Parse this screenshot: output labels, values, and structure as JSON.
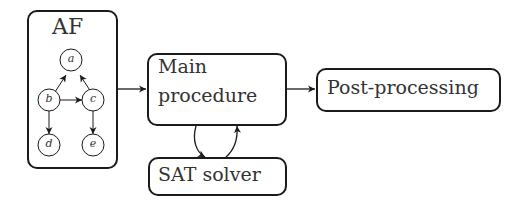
{
  "diagram": {
    "af_box": {
      "title": "AF"
    },
    "graph": {
      "nodes": [
        {
          "id": "a",
          "label": "a"
        },
        {
          "id": "b",
          "label": "b"
        },
        {
          "id": "c",
          "label": "c"
        },
        {
          "id": "d",
          "label": "d"
        },
        {
          "id": "e",
          "label": "e"
        }
      ],
      "edges": [
        {
          "from": "b",
          "to": "a"
        },
        {
          "from": "c",
          "to": "a"
        },
        {
          "from": "b",
          "to": "c"
        },
        {
          "from": "b",
          "to": "d"
        },
        {
          "from": "c",
          "to": "e"
        }
      ]
    },
    "main_box": {
      "line1": "Main",
      "line2": "procedure"
    },
    "post_box": {
      "label": "Post-processing"
    },
    "sat_box": {
      "label": "SAT solver"
    },
    "flows": [
      {
        "from": "AF",
        "to": "Main procedure"
      },
      {
        "from": "Main procedure",
        "to": "Post-processing"
      },
      {
        "from": "Main procedure",
        "to": "SAT solver"
      },
      {
        "from": "SAT solver",
        "to": "Main procedure"
      }
    ],
    "colors": {
      "stroke": "#1a1a1a",
      "text": "#333333",
      "background": "#ffffff"
    }
  }
}
